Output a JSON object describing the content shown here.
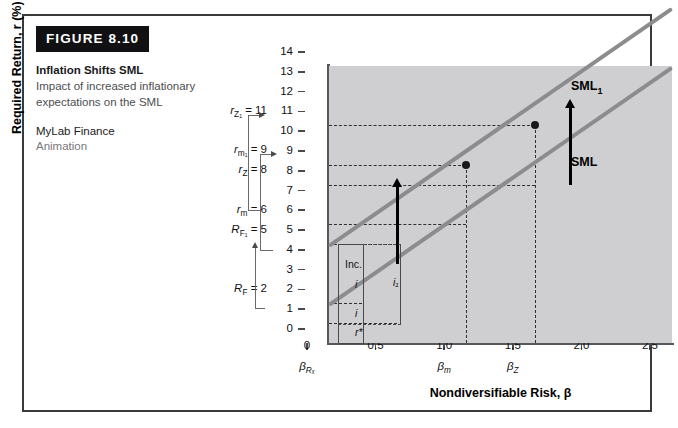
{
  "figure": {
    "badge": "FIGURE 8.10",
    "title": "Inflation Shifts SML",
    "subtitle": "Impact of increased inflationary expectations on the SML",
    "resource": "MyLab Finance",
    "resource_kind": "Animation"
  },
  "axes": {
    "y_title": "Required Return, r (%)",
    "x_title": "Nondiversifiable Risk, β",
    "y_ticks": [
      0,
      1,
      2,
      3,
      4,
      5,
      6,
      7,
      8,
      9,
      10,
      11,
      12,
      13,
      14
    ],
    "y_range": [
      0,
      14
    ],
    "x_ticks": [
      "0",
      "0.5",
      "1.0",
      "1.5",
      "2.0",
      "2.5"
    ],
    "x_tick_values": [
      0,
      0.5,
      1.0,
      1.5,
      2.0,
      2.5
    ],
    "x_range": [
      0,
      2.5
    ]
  },
  "y_annotations": [
    {
      "key": "rZ1",
      "label": "r",
      "sub": "Z₁",
      "equals": "= 11",
      "value": 11
    },
    {
      "key": "rm1",
      "label": "r",
      "sub": "m₁",
      "equals": "= 9",
      "value": 9
    },
    {
      "key": "rZ",
      "label": "r",
      "sub": "Z",
      "equals": "= 8",
      "value": 8
    },
    {
      "key": "rm",
      "label": "r",
      "sub": "m",
      "equals": "= 6",
      "value": 6
    },
    {
      "key": "RF1",
      "label": "R",
      "sub": "F₁",
      "equals": "= 5",
      "value": 5
    },
    {
      "key": "RF",
      "label": "R",
      "sub": "F",
      "equals": "= 2",
      "value": 2
    }
  ],
  "x_annotations": [
    {
      "key": "betaRF",
      "label": "β",
      "sub": "Rₓ",
      "value": 0
    },
    {
      "key": "betam",
      "label": "β",
      "sub": "m",
      "value": 1.0
    },
    {
      "key": "betaZ",
      "label": "β",
      "sub": "Z",
      "value": 1.5
    }
  ],
  "inner_labels": {
    "inc": "Inc.",
    "inc_i": "i",
    "i": "i",
    "i1": "i₁",
    "r_star": "r*"
  },
  "series_labels": {
    "sml1": "SML",
    "sml1_sub": "1",
    "sml": "SML"
  },
  "colors": {
    "plot_background": "#cfcfd1",
    "line": "#8c8c8f",
    "axis": "#58585b",
    "badge_background": "#111113",
    "frame_border": "#3a3a3c"
  },
  "chart_data": {
    "type": "line",
    "title": "Inflation Shifts SML",
    "xlabel": "Nondiversifiable Risk, β",
    "ylabel": "Required Return, r (%)",
    "xlim": [
      0,
      2.5
    ],
    "ylim": [
      0,
      14
    ],
    "grid": false,
    "legend_position": "right-inline",
    "series": [
      {
        "name": "SML",
        "intercept": 2,
        "slope": 4,
        "x": [
          0,
          2.5
        ],
        "y": [
          2,
          12
        ],
        "points": [
          {
            "label": "R_F",
            "x": 0,
            "y": 2
          },
          {
            "label": "r_m",
            "x": 1.0,
            "y": 6
          },
          {
            "label": "r_Z",
            "x": 1.5,
            "y": 8
          }
        ]
      },
      {
        "name": "SML₁",
        "intercept": 5,
        "slope": 4,
        "x": [
          0,
          2.5
        ],
        "y": [
          5,
          15
        ],
        "points": [
          {
            "label": "R_F1",
            "x": 0,
            "y": 5
          },
          {
            "label": "r_m1",
            "x": 1.0,
            "y": 9
          },
          {
            "label": "r_Z1",
            "x": 1.5,
            "y": 11
          }
        ]
      }
    ],
    "markers": [
      {
        "x": 1.0,
        "y": 9,
        "series": "SML₁"
      },
      {
        "x": 1.5,
        "y": 11,
        "series": "SML₁"
      }
    ],
    "shift_arrows": [
      {
        "x": 0.5,
        "from_y": 4,
        "to_y": 7
      },
      {
        "x": 1.75,
        "from_y": 9,
        "to_y": 12
      },
      {
        "x": 0,
        "from_y": 2,
        "to_y": 5
      }
    ],
    "hlines": [
      11,
      9,
      8,
      6,
      5,
      2,
      1
    ],
    "vlines": [
      1.0,
      1.5
    ],
    "annotations": [
      {
        "text": "Inc. i",
        "meaning": "increase in expected inflation",
        "value": 3
      },
      {
        "text": "i",
        "meaning": "original expected inflation",
        "value": 1
      },
      {
        "text": "i₁",
        "meaning": "new expected inflation",
        "value": 4
      },
      {
        "text": "r*",
        "meaning": "real rate of interest",
        "value": 1
      }
    ]
  }
}
